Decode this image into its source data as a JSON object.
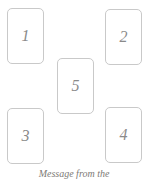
{
  "canvas": {
    "width": 148,
    "height": 183,
    "background_color": "#ffffff"
  },
  "style": {
    "card_border_color": "#c9c9c9",
    "card_fill_color": "#ffffff",
    "number_color": "#8a8a8a",
    "caption_color": "#7d7a76"
  },
  "spread": {
    "cards": [
      {
        "position_label": "1",
        "slot": "top-left"
      },
      {
        "position_label": "2",
        "slot": "top-right"
      },
      {
        "position_label": "3",
        "slot": "bottom-left"
      },
      {
        "position_label": "4",
        "slot": "bottom-right"
      },
      {
        "position_label": "5",
        "slot": "center"
      }
    ]
  },
  "caption": {
    "text": "Message from the"
  }
}
